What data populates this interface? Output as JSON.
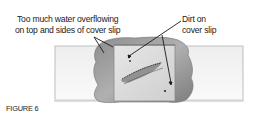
{
  "figure": {
    "caption": "FIGURE 6",
    "callouts": [
      {
        "id": "water",
        "lines": [
          "Too much water overflowing",
          "on top and sides of cover slip"
        ]
      },
      {
        "id": "dirt",
        "lines": [
          "Dirt on",
          "cover slip"
        ]
      }
    ],
    "elements": [
      "microscope-slide",
      "cover-slip",
      "excess-water",
      "specimen",
      "dirt-particles"
    ],
    "colors": {
      "slide": "#f4f4f4",
      "slide_border": "#b9b9b9",
      "water": "#9a9a9a",
      "cover_slip": "#d9d9d9",
      "leader_line": "#1a1a1a"
    }
  }
}
